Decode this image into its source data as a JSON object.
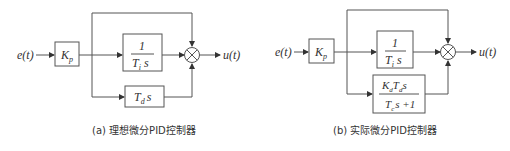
{
  "diagrams": [
    {
      "id": "a",
      "caption": "(a) 理想微分PID控制器",
      "input": "e(t)",
      "output": "u(t)",
      "gain_block": {
        "main": "K",
        "sub": "p"
      },
      "integral_block": {
        "numerator": "1",
        "denominator_main": "T",
        "denominator_sub": "i",
        "denominator_tail": " s"
      },
      "derivative_block": {
        "main": "T",
        "sub": "d",
        "tail": "s"
      },
      "summing_junction": "×"
    },
    {
      "id": "b",
      "caption": "(b) 实际微分PID控制器",
      "input": "e(t)",
      "output": "u(t)",
      "gain_block": {
        "main": "K",
        "sub": "p"
      },
      "integral_block": {
        "numerator": "1",
        "denominator_main": "T",
        "denominator_sub": "i",
        "denominator_tail": " s"
      },
      "derivative_block": {
        "numerator": {
          "k": "K",
          "k_sub": "d",
          "t": "T",
          "t_sub": "d",
          "tail": "s"
        },
        "denominator": {
          "t": "T",
          "t_sub": "c",
          "tail": "s +1"
        }
      },
      "summing_junction": "×"
    }
  ],
  "colors": {
    "line": "#555555",
    "text": "#333333",
    "background": "#ffffff"
  }
}
